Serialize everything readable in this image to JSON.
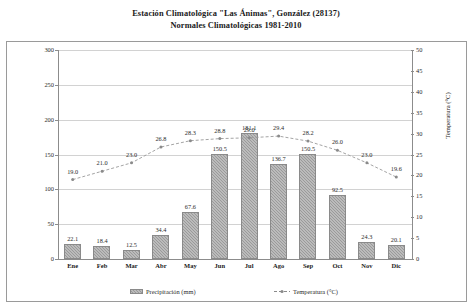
{
  "title": {
    "line1": "Estación Climatológica \"Las Ánimas\", González (28137)",
    "line2": "Normales Climatológicas 1981-2010"
  },
  "legend": {
    "precipitation": "Precipitación (mm)",
    "temperature": "Temperatura (°C)"
  },
  "chart_data": {
    "type": "bar",
    "xlabel": "",
    "ylabel": "Precipitación (mm)",
    "y2label": "Temperatura (°C)",
    "ylim": [
      0,
      300
    ],
    "y2lim": [
      0,
      50
    ],
    "yticks": [
      0,
      50,
      100,
      150,
      200,
      250,
      300
    ],
    "y2ticks": [
      0,
      5,
      10,
      15,
      20,
      25,
      30,
      35,
      40,
      45,
      50
    ],
    "grid": true,
    "legend_position": "bottom",
    "categories": [
      "Ene",
      "Feb",
      "Mar",
      "Abr",
      "May",
      "Jun",
      "Jul",
      "Ago",
      "Sep",
      "Oct",
      "Nov",
      "Dic"
    ],
    "series": [
      {
        "name": "Precipitación (mm)",
        "type": "bar",
        "axis": "left",
        "values": [
          22.1,
          18.4,
          12.5,
          34.4,
          67.6,
          150.5,
          181.1,
          136.7,
          150.5,
          92.5,
          24.3,
          20.1
        ]
      },
      {
        "name": "Temperatura (°C)",
        "type": "line",
        "axis": "right",
        "values": [
          19.0,
          21.0,
          23.0,
          26.8,
          28.3,
          28.8,
          29.0,
          29.4,
          28.2,
          26.0,
          23.0,
          19.6
        ]
      }
    ]
  }
}
